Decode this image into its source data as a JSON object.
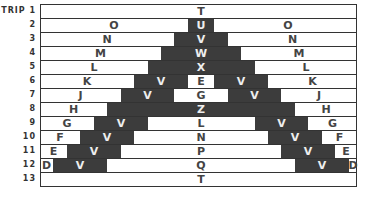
{
  "title_label": "STRIP",
  "colors": {
    "dark": "#3c3c3c",
    "light": "#ffffff",
    "line": "#333333"
  },
  "rows": [
    {
      "strip": "1",
      "left": "",
      "center": "T",
      "right": "",
      "dark": []
    },
    {
      "strip": "2",
      "left": "O",
      "center": "U",
      "right": "O",
      "dark": [
        [
          188,
          214
        ]
      ]
    },
    {
      "strip": "3",
      "left": "N",
      "center": "V",
      "right": "N",
      "dark": [
        [
          174,
          228
        ]
      ]
    },
    {
      "strip": "4",
      "left": "M",
      "center": "W",
      "right": "M",
      "dark": [
        [
          161,
          241
        ]
      ]
    },
    {
      "strip": "5",
      "left": "L",
      "center": "X",
      "right": "L",
      "dark": [
        [
          148,
          255
        ]
      ]
    },
    {
      "strip": "6",
      "left": "K",
      "center": "E",
      "right": "K",
      "dark": [
        [
          134,
          188
        ],
        [
          214,
          268
        ]
      ],
      "v_left": "V",
      "v_right": "V"
    },
    {
      "strip": "7",
      "left": "J",
      "center": "G",
      "right": "J",
      "dark": [
        [
          121,
          174
        ],
        [
          228,
          281
        ]
      ],
      "v_left": "V",
      "v_right": "V"
    },
    {
      "strip": "8",
      "left": "H",
      "center": "Z",
      "right": "H",
      "dark": [
        [
          107,
          295
        ]
      ]
    },
    {
      "strip": "9",
      "left": "G",
      "center": "L",
      "right": "G",
      "dark": [
        [
          94,
          148
        ],
        [
          255,
          308
        ]
      ],
      "v_left": "V",
      "v_right": "V"
    },
    {
      "strip": "10",
      "left": "F",
      "center": "N",
      "right": "F",
      "dark": [
        [
          80,
          134
        ],
        [
          268,
          322
        ]
      ],
      "v_left": "V",
      "v_right": "V"
    },
    {
      "strip": "11",
      "left": "E",
      "center": "P",
      "right": "E",
      "dark": [
        [
          67,
          121
        ],
        [
          281,
          335
        ]
      ],
      "v_left": "V",
      "v_right": "V"
    },
    {
      "strip": "12",
      "left": "D",
      "center": "Q",
      "right": "D",
      "dark": [
        [
          53,
          107
        ],
        [
          295,
          349
        ]
      ],
      "v_left": "V",
      "v_right": "V"
    },
    {
      "strip": "13",
      "left": "",
      "center": "T",
      "right": "",
      "dark": []
    }
  ]
}
